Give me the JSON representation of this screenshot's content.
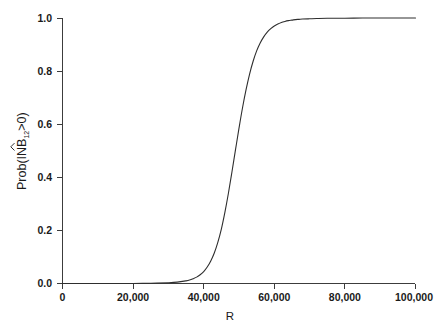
{
  "chart_data": {
    "type": "line",
    "title": "",
    "subtitle": "",
    "xlabel": "R",
    "ylabel": "Prob(INB̂12>0)",
    "ylabel_parts": {
      "prefix": "Prob(IN",
      "hatted": "B",
      "subscript": "12",
      "suffix": ">0)"
    },
    "xlim": [
      0,
      100000
    ],
    "ylim": [
      0.0,
      1.0
    ],
    "xticks": [
      0,
      20000,
      40000,
      60000,
      80000,
      100000
    ],
    "xticklabels": [
      "0",
      "20,000",
      "40,000",
      "60,000",
      "80,000",
      "100,000"
    ],
    "yticks": [
      0.0,
      0.2,
      0.4,
      0.6,
      0.8,
      1.0
    ],
    "yticklabels": [
      "0.0",
      "0.2",
      "0.4",
      "0.6",
      "0.8",
      "1.0"
    ],
    "grid": false,
    "legend": null,
    "legend_position": "none",
    "line_color": "#2e2e2e",
    "axis_color": "#3c3c3c",
    "background_color": "#ffffff",
    "series": [
      {
        "name": "Prob(INB>0)",
        "x": [
          0,
          5000,
          10000,
          15000,
          20000,
          25000,
          30000,
          32500,
          35000,
          36000,
          37000,
          38000,
          39000,
          40000,
          41000,
          42000,
          43000,
          44000,
          45000,
          46000,
          47000,
          48000,
          49000,
          50000,
          51000,
          52000,
          53000,
          54000,
          55000,
          56000,
          57000,
          58000,
          59000,
          60000,
          61000,
          62000,
          63000,
          64000,
          65000,
          66000,
          67000,
          68000,
          70000,
          72000,
          75000,
          80000,
          85000,
          90000,
          95000,
          100000
        ],
        "y": [
          0.0,
          0.0,
          0.0,
          0.0,
          0.0,
          0.001,
          0.003,
          0.005,
          0.01,
          0.013,
          0.018,
          0.024,
          0.033,
          0.045,
          0.062,
          0.085,
          0.115,
          0.155,
          0.205,
          0.268,
          0.34,
          0.42,
          0.503,
          0.585,
          0.662,
          0.73,
          0.789,
          0.837,
          0.876,
          0.906,
          0.929,
          0.947,
          0.96,
          0.97,
          0.977,
          0.983,
          0.987,
          0.99,
          0.992,
          0.994,
          0.995,
          0.996,
          0.997,
          0.998,
          0.999,
          0.999,
          1.0,
          1.0,
          1.0,
          1.0
        ]
      }
    ],
    "annotations": []
  }
}
